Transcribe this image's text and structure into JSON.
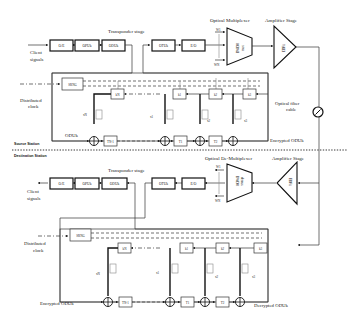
{
  "source": {
    "transponder_label": "Transponder stage",
    "client_signals": [
      "Client",
      "signals"
    ],
    "blocks": [
      "O/E",
      "OPUk",
      "ODUk",
      "OTUk",
      "E/O"
    ],
    "mux_label": "Optical Multiplexer",
    "mux_inner": [
      "DWDM",
      "mux"
    ],
    "mux_inputs": [
      "W1",
      "WN"
    ],
    "amp_label": "Amplifier Stage",
    "amp_inner": "EDFA",
    "fiber_label": [
      "Optical fiber",
      "cable"
    ],
    "distributed_clock": [
      "Distributed",
      "clock"
    ],
    "srng": "SRNG",
    "regs": [
      "kN",
      "k1",
      "k2",
      "k3"
    ],
    "switches": [
      "xN",
      "x1",
      "x2",
      "x3"
    ],
    "delays": [
      "TN-1",
      "T1",
      "T2"
    ],
    "odu_in": "ODUk",
    "odu_out": "Encrypted ODUk",
    "station": "Source Station"
  },
  "destination": {
    "station": "Destination Station",
    "transponder_label": "Transponder stage",
    "client_signals": [
      "Client",
      "signals"
    ],
    "blocks": [
      "O/E",
      "OPUk",
      "ODUk",
      "OTUk",
      "E/O"
    ],
    "demux_label": "Optical De-Multiplexer",
    "demux_inner": [
      "DWDM",
      "demux"
    ],
    "demux_outputs": [
      "W1",
      "WN"
    ],
    "amp_label": "Amplifier Stage",
    "amp_inner": "EDFA",
    "distributed_clock": [
      "Distributed",
      "clock"
    ],
    "srng": "SRNG",
    "regs": [
      "kN",
      "k1",
      "k2",
      "k3"
    ],
    "switches": [
      "xN",
      "x1",
      "x2",
      "x3"
    ],
    "delays": [
      "TN-1",
      "T1",
      "T2"
    ],
    "odu_in": "Encrypted ODUk",
    "odu_out": "Decrypted ODUk"
  }
}
